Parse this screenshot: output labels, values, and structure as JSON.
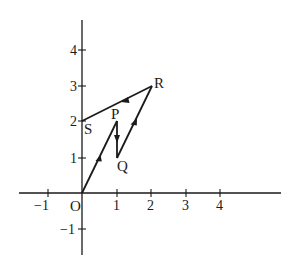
{
  "diagram": {
    "type": "vector-path-on-cartesian-axes",
    "origin_label": "O",
    "x_ticks": [
      {
        "value": -1,
        "label": "−1"
      },
      {
        "value": 1,
        "label": "1"
      },
      {
        "value": 2,
        "label": "2"
      },
      {
        "value": 3,
        "label": "3"
      },
      {
        "value": 4,
        "label": "4"
      }
    ],
    "y_ticks": [
      {
        "value": -1,
        "label": "−1"
      },
      {
        "value": 1,
        "label": "1"
      },
      {
        "value": 2,
        "label": "2"
      },
      {
        "value": 3,
        "label": "3"
      },
      {
        "value": 4,
        "label": "4"
      }
    ],
    "points": [
      {
        "name": "O",
        "x": 0,
        "y": 0
      },
      {
        "name": "P",
        "x": 1,
        "y": 2
      },
      {
        "name": "Q",
        "x": 1,
        "y": 1
      },
      {
        "name": "R",
        "x": 2,
        "y": 3
      },
      {
        "name": "S",
        "x": 0,
        "y": 2
      }
    ],
    "path_order": [
      "O",
      "P",
      "Q",
      "R",
      "S"
    ],
    "labels": {
      "O": "O",
      "P": "P",
      "Q": "Q",
      "R": "R",
      "S": "S"
    },
    "colors": {
      "ink": "#1a1a1a",
      "background": "#ffffff"
    }
  }
}
